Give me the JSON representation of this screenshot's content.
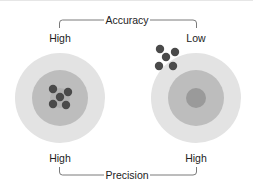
{
  "diagram": {
    "top_axis": {
      "title": "Accuracy",
      "left_label": "High",
      "right_label": "Low"
    },
    "bottom_axis": {
      "title": "Precision",
      "left_label": "High",
      "right_label": "High"
    },
    "targets": [
      {
        "name": "high-accuracy-high-precision",
        "cx": 60,
        "cy": 98,
        "cluster": "centered",
        "shots": 5
      },
      {
        "name": "low-accuracy-high-precision",
        "cx": 196,
        "cy": 98,
        "cluster": "off-target-top-left",
        "shots": 5
      }
    ],
    "colors": {
      "outer_ring": "#e3e3e3",
      "middle_ring": "#bdbdbd",
      "bullseye": "#9a9a9a",
      "shot": "#4a4a4a",
      "bracket": "#7a7a7a"
    }
  }
}
